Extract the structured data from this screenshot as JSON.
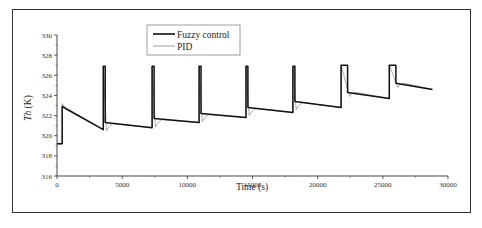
{
  "chart_data": {
    "type": "line",
    "title": "",
    "xlabel": "Time (s)",
    "ylabel": "Th (K)",
    "xlim": [
      0,
      30000
    ],
    "ylim": [
      316,
      330
    ],
    "xticks": [
      0,
      5000,
      10000,
      15000,
      20000,
      25000,
      30000
    ],
    "yticks": [
      316,
      318,
      320,
      322,
      324,
      326,
      328,
      330
    ],
    "grid": false,
    "legend_position": "upper-center",
    "series": [
      {
        "name": "Fuzzy control",
        "style": "thick black solid",
        "color": "#111111",
        "x": [
          0,
          400,
          400,
          3550,
          3550,
          3700,
          3700,
          7300,
          7300,
          7450,
          7450,
          10900,
          10900,
          11050,
          11050,
          14500,
          14500,
          14650,
          14650,
          18100,
          18100,
          18250,
          18250,
          21800,
          21800,
          22300,
          22300,
          25500,
          25500,
          26000,
          26000,
          28800
        ],
        "y": [
          319.2,
          319.2,
          322.9,
          320.6,
          326.9,
          326.9,
          321.3,
          320.8,
          326.9,
          326.9,
          321.7,
          321.3,
          326.9,
          326.9,
          322.2,
          321.8,
          326.9,
          326.9,
          322.8,
          322.3,
          326.9,
          326.9,
          323.4,
          322.8,
          327.0,
          327.0,
          324.3,
          323.7,
          327.0,
          327.0,
          325.2,
          324.6
        ]
      },
      {
        "name": "PID",
        "style": "thin gray solid, small undershoot dips after each setpoint change",
        "color": "#888888",
        "x": [
          0,
          400,
          400,
          700,
          3550,
          3550,
          3800,
          4000,
          4300,
          7300,
          7300,
          7550,
          7750,
          8050,
          10900,
          10900,
          11150,
          11350,
          11650,
          14500,
          14500,
          14750,
          14950,
          15250,
          18100,
          18100,
          18350,
          18550,
          18850,
          21800,
          21800,
          22450,
          22650,
          22950,
          25500,
          25500,
          26150,
          26350,
          26650,
          28800
        ],
        "y": [
          319.2,
          319.2,
          323.2,
          322.6,
          320.6,
          326.9,
          320.5,
          320.9,
          321.2,
          320.8,
          326.9,
          320.9,
          321.3,
          321.6,
          321.3,
          326.9,
          321.4,
          321.8,
          322.1,
          321.8,
          326.9,
          322.0,
          322.4,
          322.7,
          322.3,
          326.9,
          322.6,
          323.0,
          323.3,
          322.8,
          327.0,
          323.9,
          324.2,
          324.3,
          323.7,
          327.0,
          324.8,
          325.1,
          325.2,
          324.6
        ]
      }
    ]
  },
  "legend": {
    "items": [
      {
        "label": "Fuzzy control",
        "color": "#111111",
        "width": 1.6
      },
      {
        "label": "PID",
        "color": "#888888",
        "width": 0.8
      }
    ]
  },
  "axes": {
    "xlabel": "Time (s)",
    "ylabel_italic": "Th",
    "ylabel_unit": " (K)",
    "xtick_labels": [
      "0",
      "5000",
      "10000",
      "15000",
      "20000",
      "25000",
      "30000"
    ],
    "ytick_labels": [
      "316",
      "318",
      "320",
      "322",
      "324",
      "326",
      "328",
      "330"
    ]
  }
}
